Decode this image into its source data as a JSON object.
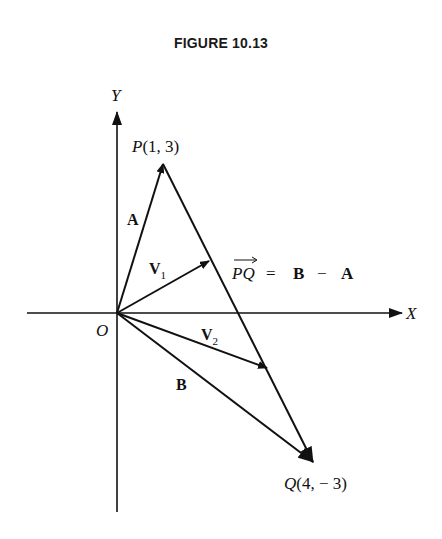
{
  "figure": {
    "title": "FIGURE 10.13"
  },
  "axes": {
    "x_label": "X",
    "y_label": "Y",
    "origin_label": "O"
  },
  "points": {
    "P": {
      "name": "P",
      "coords": "(1, 3)"
    },
    "Q": {
      "name": "Q",
      "coords": "(4, − 3)"
    }
  },
  "vectors": {
    "A": {
      "label": "A",
      "from": "O",
      "to": "P"
    },
    "B": {
      "label": "B",
      "from": "O",
      "to": "Q"
    },
    "V1": {
      "label": "V",
      "sub": "1"
    },
    "V2": {
      "label": "V",
      "sub": "2"
    },
    "PQ": {
      "label": "PQ",
      "equation": "= B − A",
      "eq_part1": "=",
      "eq_B": "B",
      "eq_minus": "−",
      "eq_A": "A"
    }
  },
  "colors": {
    "ink": "#111111",
    "background": "#ffffff"
  }
}
